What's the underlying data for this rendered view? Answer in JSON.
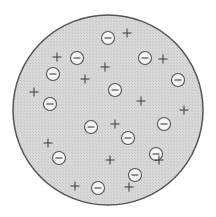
{
  "diagram": {
    "colors": {
      "background": "#ffffff",
      "disc_fill": "#d6d6d6",
      "disc_stroke": "#555555",
      "negative_fill": "#f4f4f4",
      "negative_stroke": "#555555",
      "symbol": "#444444"
    },
    "disc": {
      "cx": 108,
      "cy": 110,
      "r": 95
    },
    "negative_charges": [
      {
        "x": 108,
        "y": 38
      },
      {
        "x": 77,
        "y": 58
      },
      {
        "x": 145,
        "y": 58
      },
      {
        "x": 53,
        "y": 74
      },
      {
        "x": 178,
        "y": 80
      },
      {
        "x": 115,
        "y": 90
      },
      {
        "x": 50,
        "y": 104
      },
      {
        "x": 91,
        "y": 127
      },
      {
        "x": 164,
        "y": 124
      },
      {
        "x": 128,
        "y": 138
      },
      {
        "x": 59,
        "y": 158
      },
      {
        "x": 156,
        "y": 154
      },
      {
        "x": 135,
        "y": 175
      },
      {
        "x": 98,
        "y": 188
      }
    ],
    "positive_charges": [
      {
        "x": 127,
        "y": 33
      },
      {
        "x": 57,
        "y": 57
      },
      {
        "x": 163,
        "y": 59
      },
      {
        "x": 105,
        "y": 67
      },
      {
        "x": 85,
        "y": 79
      },
      {
        "x": 34,
        "y": 92
      },
      {
        "x": 141,
        "y": 101
      },
      {
        "x": 184,
        "y": 110
      },
      {
        "x": 115,
        "y": 124
      },
      {
        "x": 48,
        "y": 143
      },
      {
        "x": 110,
        "y": 160
      },
      {
        "x": 159,
        "y": 160
      },
      {
        "x": 75,
        "y": 186
      },
      {
        "x": 129,
        "y": 187
      }
    ],
    "legend": {
      "negative_symbol": "⊖",
      "positive_symbol": "+"
    }
  }
}
